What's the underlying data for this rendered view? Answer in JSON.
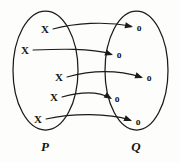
{
  "diagram": {
    "type": "mapping-diagram",
    "background_color": "#fdfdfc",
    "stroke_color": "#1a1a1a",
    "sets": [
      {
        "id": "P",
        "label": "P",
        "label_x": 45,
        "label_y": 146,
        "side": "left",
        "outline": {
          "cx": 45.5,
          "cy": 70.5,
          "rx": 32.5,
          "ry": 59.5
        },
        "elements": [
          {
            "symbol": "X",
            "x": 45,
            "y": 29
          },
          {
            "symbol": "X",
            "x": 25,
            "y": 50
          },
          {
            "symbol": "X",
            "x": 59,
            "y": 77
          },
          {
            "symbol": "X",
            "x": 54,
            "y": 97
          },
          {
            "symbol": "X",
            "x": 38,
            "y": 119
          }
        ]
      },
      {
        "id": "Q",
        "label": "Q",
        "label_x": 136,
        "label_y": 146,
        "side": "right",
        "outline": {
          "cx": 136.5,
          "cy": 70.5,
          "rx": 31.5,
          "ry": 59.5
        },
        "elements": [
          {
            "symbol": "o",
            "x": 139,
            "y": 28
          },
          {
            "symbol": "o",
            "x": 119,
            "y": 55
          },
          {
            "symbol": "o",
            "x": 149,
            "y": 78
          },
          {
            "symbol": "o",
            "x": 117,
            "y": 99
          },
          {
            "symbol": "o",
            "x": 138,
            "y": 122
          }
        ]
      }
    ],
    "arrows": [
      {
        "id": "arrow-1",
        "from": "P.0",
        "to": "Q.0",
        "path": "M 53 29 C 75 23, 105 21, 131 26",
        "head_x": 133,
        "head_y": 27,
        "head_angle": 12
      },
      {
        "id": "arrow-2",
        "from": "P.1",
        "to": "Q.1",
        "path": "M 33 50 C 60 49, 90 48, 111 54",
        "head_x": 113,
        "head_y": 55,
        "head_angle": 18
      },
      {
        "id": "arrow-3",
        "from": "P.2",
        "to": "Q.2",
        "path": "M 67 77 C 92 70, 118 70, 141 77",
        "head_x": 143,
        "head_y": 78,
        "head_angle": 20
      },
      {
        "id": "arrow-4",
        "from": "P.3",
        "to": "Q.3",
        "path": "M 62 97 C 80 92, 98 91, 110 98",
        "head_x": 112,
        "head_y": 99,
        "head_angle": 32
      },
      {
        "id": "arrow-5",
        "from": "P.4",
        "to": "Q.4",
        "path": "M 46 119 C 73 113, 108 113, 130 120",
        "head_x": 132,
        "head_y": 121,
        "head_angle": 22
      }
    ]
  }
}
